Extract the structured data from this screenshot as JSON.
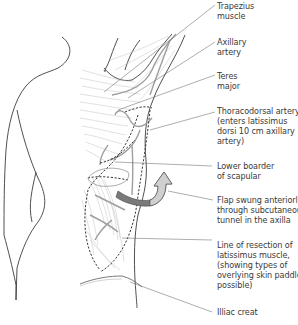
{
  "diagram": {
    "type": "anatomical-illustration",
    "colors": {
      "outline": "#3c3c3c",
      "muscle_fibers": "#b5b5b5",
      "vessels": "#9a9a9a",
      "arrow_dark": "#7a7a7a",
      "arrow_light": "#d0d0d0",
      "leader_lines": "#6a6a6a",
      "text": "#3a3a3a"
    },
    "labels": [
      {
        "id": "trapezius",
        "lines": [
          "Trapezius",
          "muscle"
        ]
      },
      {
        "id": "axillary-artery",
        "lines": [
          "Axillary",
          "artery"
        ]
      },
      {
        "id": "teres-major",
        "lines": [
          "Teres",
          "major"
        ]
      },
      {
        "id": "thoracodorsal-artery",
        "lines": [
          "Thoracodorsal artery",
          "(enters latissimus",
          "dorsi 10 cm axillary",
          "artery)"
        ]
      },
      {
        "id": "lower-border-scapula",
        "lines": [
          "Lower boarder",
          "of scapular"
        ]
      },
      {
        "id": "flap-swung",
        "lines": [
          "Flap swung anteriorly",
          "through subcutaneous",
          "tunnel in the axilla"
        ]
      },
      {
        "id": "line-of-resection",
        "lines": [
          "Line of resection of",
          "latissimus muscle,",
          "(showing types of",
          "overlying skin paddles",
          "possible)"
        ]
      },
      {
        "id": "iliac-crest",
        "lines": [
          "Illiac creat"
        ]
      }
    ]
  },
  "text": {
    "trapezius": "Trapezius\nmuscle",
    "axillary": "Axillary\nartery",
    "teres": "Teres\nmajor",
    "thoracodorsal": "Thoracodorsal artery\n(enters latissimus\ndorsi 10 cm axillary\nartery)",
    "lower_border": "Lower boarder\nof scapular",
    "flap": "Flap swung anteriorly\nthrough subcutaneous\ntunnel in the axilla",
    "resection": "Line of resection of\nlatissimus muscle,\n(showing types of\noverlying skin paddles\npossible)",
    "iliac": "Illiac creat"
  }
}
